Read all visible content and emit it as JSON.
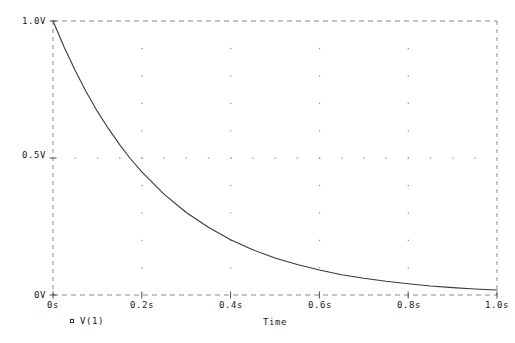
{
  "chart_data": {
    "type": "line",
    "title": "",
    "xlabel": "Time",
    "ylabel": "",
    "xlim": [
      0,
      1.0
    ],
    "ylim": [
      0,
      1.0
    ],
    "grid": true,
    "grid_style": "dotted-intersections",
    "legend_position": "below-left",
    "x_tick_labels": [
      "0s",
      "0.2s",
      "0.4s",
      "0.6s",
      "0.8s",
      "1.0s"
    ],
    "x_tick_values": [
      0,
      0.2,
      0.4,
      0.6,
      0.8,
      1.0
    ],
    "y_tick_labels": [
      "1.0V",
      "0.5V",
      "0V"
    ],
    "y_tick_values": [
      1.0,
      0.5,
      0.0
    ],
    "series": [
      {
        "name": "V(1)",
        "marker": "open-square",
        "color": "#3a3a3a",
        "description": "exponential decay, tau = 0.25 s",
        "x": [
          0.0,
          0.025,
          0.05,
          0.075,
          0.1,
          0.125,
          0.15,
          0.173,
          0.2,
          0.25,
          0.3,
          0.35,
          0.4,
          0.45,
          0.5,
          0.55,
          0.6,
          0.65,
          0.7,
          0.75,
          0.8,
          0.85,
          0.9,
          0.95,
          1.0
        ],
        "y": [
          1.0,
          0.905,
          0.819,
          0.741,
          0.67,
          0.607,
          0.549,
          0.5,
          0.449,
          0.368,
          0.301,
          0.247,
          0.202,
          0.165,
          0.135,
          0.111,
          0.091,
          0.074,
          0.061,
          0.05,
          0.041,
          0.033,
          0.027,
          0.022,
          0.018
        ]
      }
    ]
  },
  "legend": {
    "entries": [
      {
        "label": "V(1)",
        "marker": "open-square"
      }
    ]
  },
  "axes": {
    "x_title": "Time",
    "frame_color": "#8a8a8a",
    "curve_color": "#3a3a3a",
    "grid_dot_color": "#9a9a9a"
  }
}
